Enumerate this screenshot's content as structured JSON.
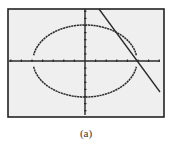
{
  "figure": {
    "caption": "(a)",
    "screen": {
      "background": "#efefef",
      "frame_color": "#222222",
      "plot_color": "#2a2a2a",
      "frame": {
        "x": 8,
        "y": 9,
        "width": 156,
        "height": 108
      }
    },
    "axes": {
      "origin_px": [
        85,
        61
      ],
      "x_axis": {
        "from": 9,
        "to": 160,
        "tick_spacing_px": 10.6,
        "tick_count_each_side": 7
      },
      "y_axis": {
        "from": 9,
        "to": 115,
        "tick_spacing_px": 7.1,
        "tick_count_up": 7,
        "tick_count_down": 7
      }
    },
    "curves": {
      "ellipse": {
        "type": "ellipse",
        "style": "dotted-graph",
        "center_px": [
          85,
          61
        ],
        "rx_px": 52,
        "ry_px": 36,
        "gap_at_x_axis": true
      },
      "line": {
        "type": "line",
        "from_px": [
          99,
          9
        ],
        "to_px": [
          160,
          92
        ]
      }
    }
  }
}
